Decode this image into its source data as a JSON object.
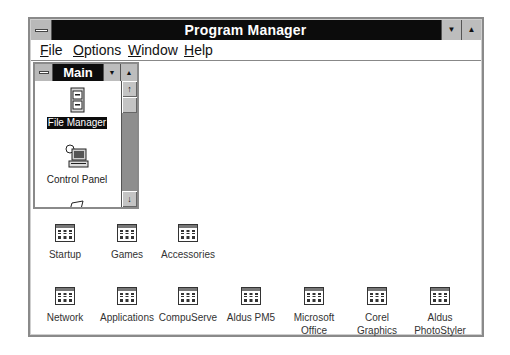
{
  "window": {
    "title": "Program Manager",
    "minimize_glyph": "▼",
    "maximize_glyph": "▲"
  },
  "menubar": {
    "items": [
      {
        "label": "File",
        "accel": "F",
        "rest": "ile"
      },
      {
        "label": "Options",
        "accel": "O",
        "rest": "ptions"
      },
      {
        "label": "Window",
        "accel": "W",
        "rest": "indow"
      },
      {
        "label": "Help",
        "accel": "H",
        "rest": "elp"
      }
    ]
  },
  "main_group": {
    "title": "Main",
    "minimize_glyph": "▼",
    "maximize_glyph": "▲",
    "scroll_up_glyph": "↑",
    "scroll_down_glyph": "↓",
    "items": [
      {
        "label": "File Manager",
        "icon": "file-cabinet-icon",
        "selected": true
      },
      {
        "label": "Control Panel",
        "icon": "control-panel-icon",
        "selected": false
      },
      {
        "label": "",
        "icon": "print-manager-icon",
        "selected": false
      }
    ]
  },
  "group_icons": [
    {
      "label": "Startup"
    },
    {
      "label": "Games"
    },
    {
      "label": "Accessories"
    },
    {
      "label": "Network"
    },
    {
      "label": "Applications"
    },
    {
      "label": "CompuServe"
    },
    {
      "label": "Aldus PM5"
    },
    {
      "label": "Microsoft Office",
      "line1": "Microsoft",
      "line2": "Office"
    },
    {
      "label": "Corel Graphics",
      "line1": "Corel",
      "line2": "Graphics"
    },
    {
      "label": "Aldus PhotoStyler",
      "line1": "Aldus",
      "line2": "PhotoStyler"
    }
  ],
  "colors": {
    "titlebar": "#0c0c0c",
    "frame": "#8a8a8a",
    "button_face": "#bdbdbd",
    "scroll_track": "#8e8e8e"
  }
}
